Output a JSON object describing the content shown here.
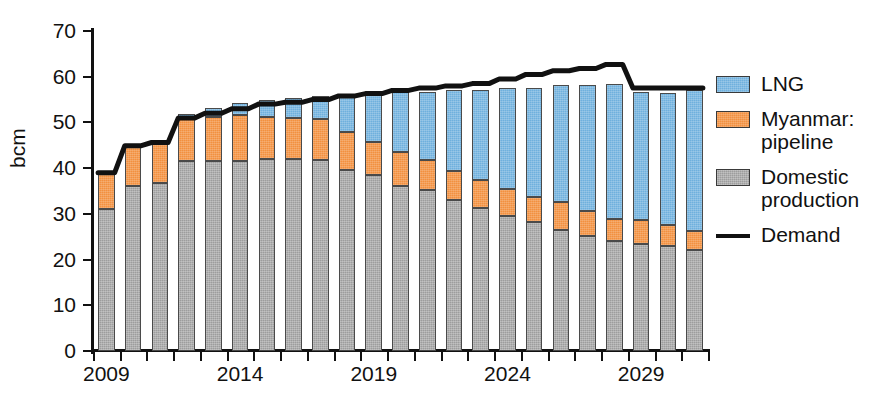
{
  "chart_data": {
    "type": "bar",
    "title": "",
    "subtitle": "",
    "xlabel": "",
    "ylabel": "bcm",
    "ylim": [
      0,
      70
    ],
    "ytick_values": [
      0,
      10,
      20,
      30,
      40,
      50,
      60,
      70
    ],
    "ytick_labels": [
      "0",
      "10",
      "20",
      "30",
      "40",
      "50",
      "60",
      "70"
    ],
    "xtick_labels": [
      "2009",
      "2014",
      "2019",
      "2024",
      "2029"
    ],
    "xtick_years": [
      2009,
      2014,
      2019,
      2024,
      2029
    ],
    "grid": false,
    "stacked": true,
    "legend_position": "right",
    "categories": [
      "2009",
      "2010",
      "2011",
      "2012",
      "2013",
      "2014",
      "2015",
      "2016",
      "2017",
      "2018",
      "2019",
      "2020",
      "2021",
      "2022",
      "2023",
      "2024",
      "2025",
      "2026",
      "2027",
      "2028",
      "2029",
      "2030",
      "2031"
    ],
    "series": [
      {
        "name": "Domestic production",
        "color": "#9d9d9d",
        "values": [
          31.0,
          36.0,
          36.8,
          41.5,
          41.6,
          41.5,
          42.0,
          42.0,
          41.8,
          39.5,
          38.5,
          36.2,
          35.2,
          33.0,
          31.2,
          29.5,
          28.2,
          26.5,
          25.2,
          24.0,
          23.5,
          23.0,
          22.0
        ]
      },
      {
        "name": "Myanmar: pipeline",
        "color": "#f2903f",
        "values": [
          8.0,
          8.9,
          8.7,
          9.4,
          9.6,
          10.2,
          9.2,
          9.0,
          9.0,
          8.4,
          7.2,
          7.4,
          6.5,
          6.4,
          6.2,
          6.0,
          5.4,
          6.0,
          5.4,
          4.9,
          5.2,
          4.5,
          4.2
        ]
      },
      {
        "name": "LNG",
        "color": "#6fb0dd",
        "values": [
          0.0,
          0.0,
          0.7,
          0.9,
          2.0,
          2.5,
          3.8,
          4.3,
          5.0,
          8.0,
          10.2,
          13.0,
          15.0,
          17.6,
          19.8,
          22.0,
          24.0,
          25.6,
          27.6,
          29.6,
          28.0,
          29.0,
          31.0
        ]
      }
    ],
    "demand_line": {
      "name": "Demand",
      "color": "#111111",
      "values": [
        39.0,
        44.9,
        45.6,
        51.0,
        52.0,
        53.0,
        54.0,
        54.4,
        55.0,
        55.8,
        56.3,
        57.0,
        57.5,
        58.0,
        58.5,
        59.5,
        60.5,
        61.3,
        61.8,
        62.7,
        57.5,
        57.5,
        57.5
      ]
    }
  },
  "legend": {
    "items": [
      {
        "label": "LNG",
        "kind": "swatch",
        "color": "#6fb0dd"
      },
      {
        "label": "Myanmar: pipeline",
        "kind": "swatch",
        "color": "#f2903f"
      },
      {
        "label": "Domestic production",
        "kind": "swatch",
        "color": "#9d9d9d"
      },
      {
        "label": "Demand",
        "kind": "line",
        "color": "#111111"
      }
    ]
  }
}
